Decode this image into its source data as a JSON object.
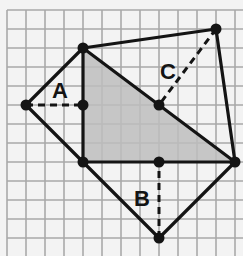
{
  "diagram": {
    "type": "geometry-grid",
    "grid": {
      "origin_px": [
        7,
        10
      ],
      "cell_px": 19,
      "cols": 12,
      "rows": 12,
      "line_color": "#a9a9a9",
      "background": "#f3f3f3"
    },
    "points": {
      "top": [
        4,
        2
      ],
      "left": [
        1,
        5
      ],
      "a_foot": [
        4,
        5
      ],
      "bottom_left": [
        4,
        8
      ],
      "b_foot": [
        8,
        8
      ],
      "right": [
        12,
        8
      ],
      "bottom": [
        8,
        12
      ],
      "top_right": [
        11,
        1
      ],
      "c_foot": [
        8,
        5
      ]
    },
    "shaded_triangle": {
      "vertices": [
        "top",
        "bottom_left",
        "right"
      ],
      "fill": "#bdbdbd"
    },
    "triangles": [
      {
        "name": "A",
        "vertices": [
          "top",
          "left",
          "bottom_left"
        ],
        "height_from": "left",
        "height_to": "a_foot"
      },
      {
        "name": "B",
        "vertices": [
          "bottom_left",
          "right",
          "bottom"
        ],
        "height_from": "bottom",
        "height_to": "b_foot"
      },
      {
        "name": "C",
        "vertices": [
          "top",
          "top_right",
          "right"
        ],
        "height_from": "top_right",
        "height_to": "c_foot"
      }
    ],
    "labels": [
      {
        "text": "A",
        "pos_px": [
          52,
          98
        ]
      },
      {
        "text": "B",
        "pos_px": [
          134,
          206
        ]
      },
      {
        "text": "C",
        "pos_px": [
          160,
          79
        ]
      }
    ],
    "stroke_color": "#141414"
  }
}
